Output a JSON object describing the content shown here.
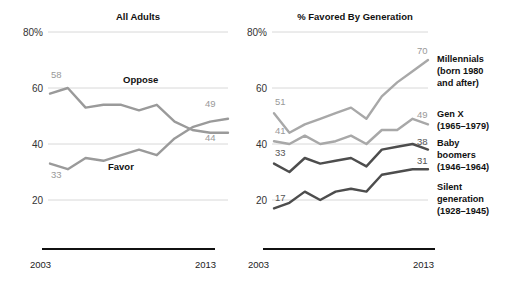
{
  "chart_data": [
    {
      "type": "line",
      "title": "All Adults",
      "xlabel": "",
      "ylabel": "",
      "ylim": [
        12,
        80
      ],
      "xlim": [
        2003,
        2013
      ],
      "grid": true,
      "legend": "inline",
      "yticks": [
        "80%",
        "60",
        "40",
        "20"
      ],
      "ytick_values": [
        80,
        60,
        40,
        20
      ],
      "xticks": [
        "2003",
        "2013"
      ],
      "xtick_values": [
        2003,
        2013
      ],
      "x": [
        2003,
        2004,
        2005,
        2006,
        2007,
        2008,
        2009,
        2010,
        2011,
        2012,
        2013
      ],
      "series": [
        {
          "name": "Oppose",
          "color": "#9a9a9a",
          "start_label": "58",
          "end_label": "44",
          "values": [
            58,
            60,
            53,
            54,
            54,
            52,
            54,
            48,
            45,
            44,
            44
          ]
        },
        {
          "name": "Favor",
          "color": "#9a9a9a",
          "start_label": "33",
          "end_label": "49",
          "values": [
            33,
            31,
            35,
            34,
            36,
            38,
            36,
            42,
            46,
            48,
            49
          ]
        }
      ]
    },
    {
      "type": "line",
      "title": "% Favored By Generation",
      "xlabel": "",
      "ylabel": "",
      "ylim": [
        12,
        80
      ],
      "xlim": [
        2003,
        2013
      ],
      "grid": true,
      "legend": "right",
      "yticks": [
        "80%",
        "60",
        "40",
        "20"
      ],
      "ytick_values": [
        80,
        60,
        40,
        20
      ],
      "xticks": [
        "2003",
        "2013"
      ],
      "xtick_values": [
        2003,
        2013
      ],
      "x": [
        2003,
        2004,
        2005,
        2006,
        2007,
        2008,
        2009,
        2010,
        2011,
        2012,
        2013
      ],
      "series": [
        {
          "name": "Millennials",
          "legend_line1": "Millennials",
          "legend_line2": "(born 1980",
          "legend_line3": "and after)",
          "color": "#a8a8a8",
          "start_label": "51",
          "end_label": "70",
          "values": [
            51,
            44,
            47,
            49,
            51,
            53,
            49,
            57,
            62,
            66,
            70
          ]
        },
        {
          "name": "Gen X",
          "legend_line1": "Gen X",
          "legend_line2": "(1965–1979)",
          "legend_line3": "",
          "color": "#a8a8a8",
          "start_label": "41",
          "end_label": "49",
          "values": [
            41,
            40,
            43,
            40,
            41,
            43,
            40,
            45,
            45,
            49,
            47
          ]
        },
        {
          "name": "Baby boomers",
          "legend_line1": "Baby",
          "legend_line2": "boomers",
          "legend_line3": "(1946–1964)",
          "color": "#4d4d4d",
          "start_label": "33",
          "end_label": "38",
          "values": [
            33,
            30,
            35,
            33,
            34,
            35,
            32,
            38,
            39,
            40,
            38
          ]
        },
        {
          "name": "Silent generation",
          "legend_line1": "Silent",
          "legend_line2": "generation",
          "legend_line3": "(1928–1945)",
          "color": "#4d4d4d",
          "start_label": "17",
          "end_label": "31",
          "values": [
            17,
            19,
            23,
            20,
            23,
            24,
            23,
            29,
            30,
            31,
            31
          ]
        }
      ]
    }
  ],
  "colors": {
    "light_series": "#a8a8a8",
    "dark_series": "#4d4d4d",
    "gridline": "#d8d8d8",
    "baseline": "#111111",
    "value_label": "#999999",
    "text": "#111111"
  }
}
